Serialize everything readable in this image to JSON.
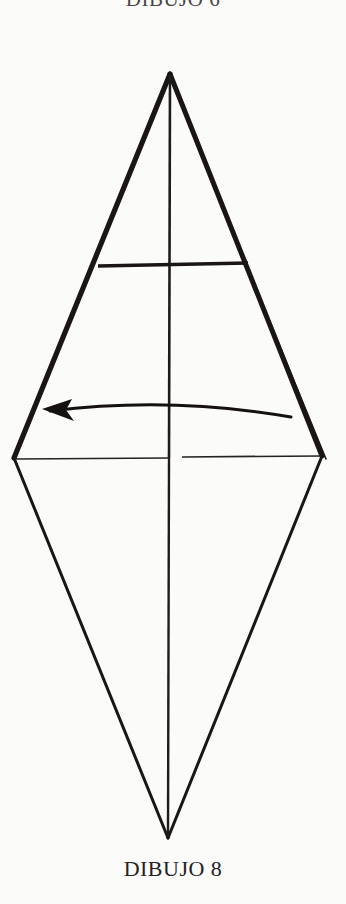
{
  "page": {
    "background_color": "#fbfbfa",
    "ink_color": "#1a1613",
    "width": 346,
    "height": 904
  },
  "caption_top": {
    "text": "DIBUJO 6",
    "note": "clipped at top edge of image"
  },
  "caption_bottom": {
    "text": "DIBUJO 8"
  },
  "figure": {
    "name": "origami-kite-fold-diagram",
    "vertices": {
      "top_apex": [
        170,
        74
      ],
      "left": [
        14,
        458
      ],
      "right": [
        322,
        456
      ],
      "bottom_apex": [
        168,
        838
      ]
    },
    "center_crease": {
      "from": [
        170,
        74
      ],
      "to": [
        168,
        838
      ]
    },
    "upper_horizontal_crease": {
      "from": [
        98,
        266
      ],
      "to": [
        248,
        263
      ]
    },
    "mid_horizontal_crease": {
      "from": [
        14,
        458
      ],
      "to": [
        322,
        456
      ],
      "gap_from": 170,
      "gap_to": 181
    },
    "fold_arrow": {
      "direction": "left",
      "start": [
        291,
        417
      ],
      "end": [
        44,
        410
      ],
      "control": [
        168,
        398
      ]
    }
  }
}
